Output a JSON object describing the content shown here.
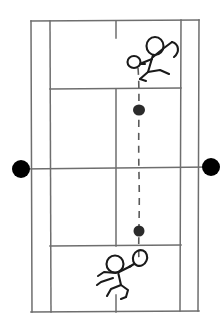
{
  "scene": {
    "title": "Tennis court diagram with two stick-figure players and ball trajectory",
    "width": 223,
    "height": 334,
    "background_color": "#ffffff",
    "line_color": "#6e6e6e",
    "ink_color": "#1a1a1a",
    "ball_color": "#2b2b2b",
    "post_color": "#000000",
    "style": "hand-drawn sketch, black ink on white"
  },
  "court": {
    "name": "tennis-court",
    "orientation": "vertical",
    "bounds": {
      "left": 31,
      "top": 21,
      "right": 199,
      "bottom": 312
    },
    "lines": {
      "baseline_top": {
        "x1": 31,
        "y1": 21,
        "x2": 199,
        "y2": 20
      },
      "baseline_bottom": {
        "x1": 31,
        "y1": 312,
        "x2": 199,
        "y2": 311
      },
      "sideline_doubles_left": {
        "x1": 31,
        "y1": 21,
        "x2": 32,
        "y2": 312
      },
      "sideline_doubles_right": {
        "x1": 199,
        "y1": 20,
        "x2": 198,
        "y2": 311
      },
      "sideline_singles_left": {
        "x1": 50,
        "y1": 21,
        "x2": 51,
        "y2": 312
      },
      "sideline_singles_right": {
        "x1": 181,
        "y1": 20,
        "x2": 180,
        "y2": 311
      },
      "service_line_top": {
        "x1": 50,
        "y1": 89,
        "x2": 181,
        "y2": 88
      },
      "service_line_bottom": {
        "x1": 50,
        "y1": 246,
        "x2": 181,
        "y2": 245
      },
      "center_service_line": {
        "x1": 116,
        "y1": 89,
        "x2": 116,
        "y2": 246
      },
      "center_mark_top": {
        "x1": 116,
        "y1": 21,
        "x2": 116,
        "y2": 38
      },
      "center_mark_bottom": {
        "x1": 116,
        "y1": 295,
        "x2": 116,
        "y2": 312
      },
      "net": {
        "x1": 31,
        "y1": 169,
        "x2": 199,
        "y2": 166
      }
    }
  },
  "net_posts": [
    {
      "label": "left-net-post",
      "cx": 21,
      "cy": 169,
      "r": 9
    },
    {
      "label": "right-net-post",
      "cx": 211,
      "cy": 167,
      "r": 9
    }
  ],
  "balls": [
    {
      "label": "ball-upper",
      "cx": 139,
      "cy": 110,
      "rx": 6,
      "ry": 5.5
    },
    {
      "label": "ball-lower",
      "cx": 139,
      "cy": 231,
      "rx": 5.5,
      "ry": 5.5
    }
  ],
  "trajectory": {
    "label": "ball-trajectory",
    "style": "dashed",
    "dash_pattern": "7 6",
    "points": [
      [
        138,
        68
      ],
      [
        139,
        110
      ],
      [
        139,
        175
      ],
      [
        139,
        231
      ],
      [
        139,
        262
      ]
    ]
  },
  "players": [
    {
      "id": "player-top",
      "label": "Top player (far court)",
      "position_side": "far",
      "holds": "racket",
      "head": {
        "cx": 155,
        "cy": 46,
        "rx": 8.5,
        "ry": 9
      },
      "racket_head": {
        "cx": 134,
        "cy": 62,
        "rx": 6.5,
        "ry": 6
      }
    },
    {
      "id": "player-bottom",
      "label": "Bottom player (near court)",
      "position_side": "near",
      "holds": "racket",
      "head": {
        "cx": 115,
        "cy": 264,
        "rx": 8.5,
        "ry": 8.5
      },
      "racket_head": {
        "cx": 140,
        "cy": 258,
        "rx": 7,
        "ry": 8
      }
    }
  ]
}
